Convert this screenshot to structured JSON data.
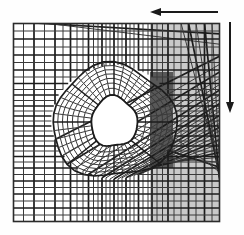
{
  "figure": {
    "type": "finite-element-mesh-diagram",
    "background_color": "#fefefe"
  },
  "domain": {
    "name": "mesh-domain-box",
    "x": 13,
    "y": 23,
    "width": 207,
    "height": 199,
    "border_color": "#2b2b2b",
    "border_width": 1.6,
    "fill_color": "#ffffff"
  },
  "mesh": {
    "line_color": "#3a3a3a",
    "line_width": 1.0,
    "bold_line_color": "#1c1c1c",
    "bold_line_width": 1.7,
    "description": "structured quadrilateral grid, graded toward centre, with a radially distorted sub-mesh surrounding a circular void",
    "x_grid": [
      13,
      23.5,
      34,
      44.5,
      55,
      63,
      70.5,
      77,
      83,
      88.5,
      93.5,
      98,
      102,
      106,
      110,
      114,
      118,
      122,
      126,
      130,
      134,
      138.5,
      143,
      148,
      152,
      157,
      162.5,
      168,
      174,
      181,
      188.5,
      196,
      204.5,
      212,
      220
    ],
    "y_grid": [
      23,
      31,
      39,
      47,
      55,
      62.5,
      70,
      77,
      83.5,
      89.5,
      95,
      100.5,
      106,
      111,
      116,
      121,
      126,
      131,
      136,
      141,
      146,
      151,
      156.5,
      162,
      168,
      174.5,
      181,
      187.5,
      194,
      201,
      208,
      215,
      222
    ],
    "bold_x_lines": [
      13,
      34,
      55,
      70.5,
      88.5,
      102,
      114,
      126,
      138.5,
      152,
      168,
      188.5,
      204.5,
      220
    ],
    "bold_y_lines": [
      23,
      39,
      55,
      70,
      83.5,
      95,
      106,
      116,
      126,
      136,
      146,
      156.5,
      168,
      181,
      194,
      208,
      222
    ]
  },
  "hole": {
    "name": "circular-void",
    "center_x": 114,
    "center_y": 122,
    "radius_x": 23,
    "radius_y": 25,
    "fill_color": "#ffffff",
    "description": "central hole / inclusion where mesh is graded radially"
  },
  "refined_zone": {
    "name": "distorted-mesh-zone",
    "center_x": 114,
    "center_y": 122,
    "radius_x": 62,
    "radius_y": 56,
    "radial_rings": 7,
    "angular_divisions": 40,
    "description": "unstructured transition band of skewed quadrilaterals blending the radial hole mesh into the background grid"
  },
  "regions": [
    {
      "name": "light-gray-material-region",
      "label": "light gray material band",
      "x": 150,
      "y": 23,
      "width": 70,
      "height": 199,
      "fill_color": "#c9c9c9",
      "opacity": 1
    },
    {
      "name": "dark-gray-material-region",
      "label": "dark gray material band",
      "x": 150,
      "y": 72,
      "width": 23,
      "height": 96,
      "fill_color": "#585858",
      "opacity": 1
    }
  ],
  "arrows": [
    {
      "name": "horizontal-load-arrow",
      "direction": "left",
      "x1": 218,
      "y1": 12,
      "x2": 150,
      "y2": 12,
      "color": "#1a1a1a",
      "line_width": 2.0,
      "head_length": 11,
      "head_width": 8
    },
    {
      "name": "vertical-load-arrow",
      "direction": "down",
      "x1": 230,
      "y1": 22,
      "x2": 230,
      "y2": 113,
      "color": "#1a1a1a",
      "line_width": 2.0,
      "head_length": 11,
      "head_width": 8
    }
  ]
}
